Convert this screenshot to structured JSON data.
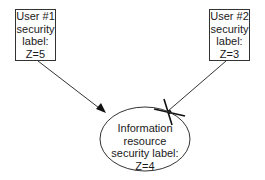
{
  "diagram": {
    "nodes": [
      {
        "id": "user1",
        "lines": [
          "User #1",
          "security",
          "label:",
          "Z=5"
        ]
      },
      {
        "id": "user2",
        "lines": [
          "User #2",
          "security",
          "label:",
          "Z=3"
        ]
      },
      {
        "id": "resource",
        "lines": [
          "Information",
          "resource",
          "security label:",
          "Z=4"
        ]
      }
    ],
    "edges": [
      {
        "from": "user1",
        "to": "resource",
        "style": "arrow",
        "blocked": false
      },
      {
        "from": "user2",
        "to": "resource",
        "style": "line",
        "blocked": true,
        "marker": "X"
      }
    ],
    "colors": {
      "stroke": "#1a1a1a",
      "background": "#ffffff"
    }
  }
}
